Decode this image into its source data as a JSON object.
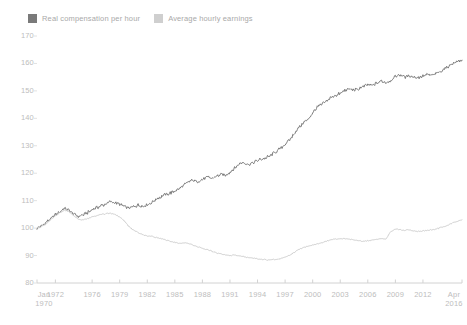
{
  "legend": {
    "position": "top-left",
    "items": [
      {
        "label": "Real compensation per hour",
        "color": "#7a7a7a",
        "icon": "legend-swatch-icon"
      },
      {
        "label": "Average hourly earnings",
        "color": "#cfcfcf",
        "icon": "legend-swatch-icon"
      }
    ]
  },
  "axes": {
    "y_ticks": [
      "170",
      "160",
      "150",
      "140",
      "130",
      "120",
      "110",
      "100",
      "90",
      "80"
    ],
    "x_ticks": [
      {
        "line1": "Jan",
        "line2": "1970"
      },
      {
        "line1": "1972",
        "line2": ""
      },
      {
        "line1": "1976",
        "line2": ""
      },
      {
        "line1": "1979",
        "line2": ""
      },
      {
        "line1": "1982",
        "line2": ""
      },
      {
        "line1": "1985",
        "line2": ""
      },
      {
        "line1": "1988",
        "line2": ""
      },
      {
        "line1": "1991",
        "line2": ""
      },
      {
        "line1": "1994",
        "line2": ""
      },
      {
        "line1": "1997",
        "line2": ""
      },
      {
        "line1": "2000",
        "line2": ""
      },
      {
        "line1": "2003",
        "line2": ""
      },
      {
        "line1": "2006",
        "line2": ""
      },
      {
        "line1": "2009",
        "line2": ""
      },
      {
        "line1": "2012",
        "line2": ""
      },
      {
        "line1": "Apr",
        "line2": "2016"
      }
    ]
  },
  "chart_data": {
    "type": "line",
    "title": "",
    "subtitle": "",
    "xlabel": "",
    "ylabel": "",
    "ylim": [
      80,
      170
    ],
    "xlim": [
      1970.0,
      2016.25
    ],
    "grid": false,
    "legend_position": "top-left",
    "x_tick_values": [
      1970.0,
      1972,
      1976,
      1979,
      1982,
      1985,
      1988,
      1991,
      1994,
      1997,
      2000,
      2003,
      2006,
      2009,
      2012,
      2016.25
    ],
    "y_tick_values": [
      80,
      90,
      100,
      110,
      120,
      130,
      140,
      150,
      160,
      170
    ],
    "series": [
      {
        "name": "Real compensation per hour",
        "color": "#7a7a7a",
        "x": [
          1970.0,
          1970.5,
          1971.0,
          1971.5,
          1972.0,
          1972.5,
          1973.0,
          1973.5,
          1974.0,
          1974.5,
          1975.0,
          1975.5,
          1976.0,
          1976.5,
          1977.0,
          1977.5,
          1978.0,
          1978.5,
          1979.0,
          1979.5,
          1980.0,
          1980.5,
          1981.0,
          1981.5,
          1982.0,
          1982.5,
          1983.0,
          1983.5,
          1984.0,
          1984.5,
          1985.0,
          1985.5,
          1986.0,
          1986.5,
          1987.0,
          1987.5,
          1988.0,
          1988.5,
          1989.0,
          1989.5,
          1990.0,
          1990.5,
          1991.0,
          1991.5,
          1992.0,
          1992.5,
          1993.0,
          1993.5,
          1994.0,
          1994.5,
          1995.0,
          1995.5,
          1996.0,
          1996.5,
          1997.0,
          1997.5,
          1998.0,
          1998.5,
          1999.0,
          1999.5,
          2000.0,
          2000.5,
          2001.0,
          2001.5,
          2002.0,
          2002.5,
          2003.0,
          2003.5,
          2004.0,
          2004.5,
          2005.0,
          2005.5,
          2006.0,
          2006.5,
          2007.0,
          2007.5,
          2008.0,
          2008.5,
          2009.0,
          2009.5,
          2010.0,
          2010.5,
          2011.0,
          2011.5,
          2012.0,
          2012.5,
          2013.0,
          2013.5,
          2014.0,
          2014.5,
          2015.0,
          2015.5,
          2016.0,
          2016.25
        ],
        "y": [
          100.0,
          100.8,
          102.0,
          103.4,
          104.8,
          106.0,
          107.2,
          106.4,
          105.0,
          104.2,
          104.8,
          105.6,
          106.8,
          107.4,
          108.2,
          108.8,
          109.6,
          109.2,
          108.6,
          108.0,
          107.2,
          107.8,
          108.4,
          108.0,
          108.6,
          109.4,
          110.6,
          111.4,
          112.2,
          112.8,
          113.6,
          114.4,
          115.8,
          116.8,
          117.4,
          117.0,
          117.8,
          118.6,
          118.2,
          118.8,
          119.6,
          119.2,
          120.4,
          121.8,
          123.4,
          124.0,
          123.2,
          123.8,
          124.6,
          125.2,
          125.8,
          126.6,
          127.8,
          129.0,
          130.6,
          132.2,
          134.4,
          136.6,
          138.4,
          139.6,
          142.0,
          144.2,
          145.0,
          146.2,
          147.6,
          148.4,
          149.0,
          150.2,
          150.8,
          150.2,
          150.8,
          151.6,
          152.4,
          152.0,
          152.8,
          153.6,
          153.0,
          153.8,
          155.2,
          155.8,
          155.0,
          155.6,
          155.2,
          154.8,
          155.4,
          156.0,
          155.6,
          156.4,
          157.2,
          158.4,
          159.6,
          160.4,
          161.0,
          161.2
        ]
      },
      {
        "name": "Average hourly earnings",
        "color": "#cfcfcf",
        "x": [
          1970.0,
          1970.5,
          1971.0,
          1971.5,
          1972.0,
          1972.5,
          1973.0,
          1973.5,
          1974.0,
          1974.5,
          1975.0,
          1975.5,
          1976.0,
          1976.5,
          1977.0,
          1977.5,
          1978.0,
          1978.5,
          1979.0,
          1979.5,
          1980.0,
          1980.5,
          1981.0,
          1981.5,
          1982.0,
          1982.5,
          1983.0,
          1983.5,
          1984.0,
          1984.5,
          1985.0,
          1985.5,
          1986.0,
          1986.5,
          1987.0,
          1987.5,
          1988.0,
          1988.5,
          1989.0,
          1989.5,
          1990.0,
          1990.5,
          1991.0,
          1991.5,
          1992.0,
          1992.5,
          1993.0,
          1993.5,
          1994.0,
          1994.5,
          1995.0,
          1995.5,
          1996.0,
          1996.5,
          1997.0,
          1997.5,
          1998.0,
          1998.5,
          1999.0,
          1999.5,
          2000.0,
          2000.5,
          2001.0,
          2001.5,
          2002.0,
          2002.5,
          2003.0,
          2003.5,
          2004.0,
          2004.5,
          2005.0,
          2005.5,
          2006.0,
          2006.5,
          2007.0,
          2007.5,
          2008.0,
          2008.5,
          2009.0,
          2009.5,
          2010.0,
          2010.5,
          2011.0,
          2011.5,
          2012.0,
          2012.5,
          2013.0,
          2013.5,
          2014.0,
          2014.5,
          2015.0,
          2015.5,
          2016.0,
          2016.25
        ],
        "y": [
          100.0,
          100.6,
          101.6,
          103.0,
          104.4,
          105.6,
          106.6,
          106.0,
          104.4,
          103.2,
          103.0,
          103.4,
          104.2,
          104.6,
          105.0,
          105.2,
          105.4,
          105.0,
          104.0,
          102.6,
          100.6,
          99.2,
          98.4,
          97.6,
          97.2,
          97.0,
          96.6,
          96.2,
          95.6,
          95.2,
          94.8,
          94.4,
          94.6,
          94.4,
          93.8,
          93.2,
          92.6,
          92.2,
          91.6,
          91.0,
          90.6,
          90.2,
          90.0,
          90.2,
          90.0,
          89.6,
          89.2,
          89.0,
          88.8,
          88.6,
          88.4,
          88.4,
          88.6,
          88.8,
          89.4,
          90.2,
          91.2,
          92.2,
          93.0,
          93.4,
          93.8,
          94.2,
          94.6,
          95.2,
          95.8,
          96.0,
          96.0,
          96.2,
          96.0,
          95.6,
          95.4,
          95.2,
          95.4,
          95.6,
          96.0,
          96.2,
          96.0,
          98.8,
          99.6,
          99.4,
          99.2,
          99.4,
          99.0,
          98.8,
          99.0,
          99.2,
          99.4,
          99.8,
          100.2,
          100.8,
          101.6,
          102.2,
          102.8,
          103.0
        ]
      }
    ]
  }
}
